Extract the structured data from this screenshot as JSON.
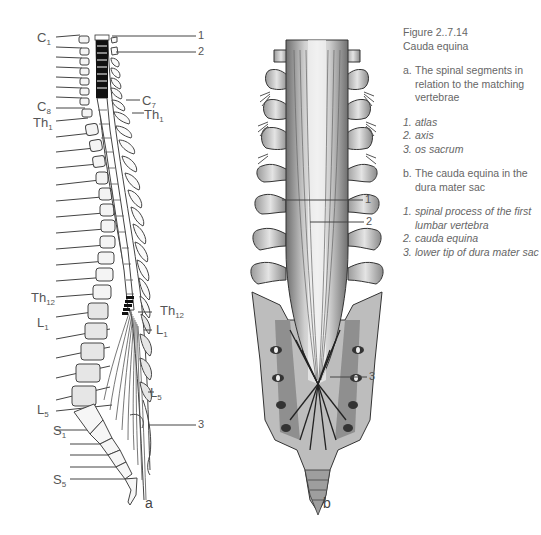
{
  "caption": {
    "figure_number": "Figure 2..7.14",
    "title": "Cauda equina",
    "part_a": {
      "key": "a.",
      "text": "The spinal segments in relation to the matching vertebrae",
      "items": [
        {
          "key": "1.",
          "text": "atlas"
        },
        {
          "key": "2.",
          "text": "axis"
        },
        {
          "key": "3.",
          "text": "os sacrum"
        }
      ]
    },
    "part_b": {
      "key": "b.",
      "text": "The cauda equina in the dura mater sac",
      "items": [
        {
          "key": "1.",
          "text": "spinal process of the first lumbar vertebra"
        },
        {
          "key": "2.",
          "text": "cauda equina"
        },
        {
          "key": "3.",
          "text": "lower tip of dura mater sac"
        }
      ]
    }
  },
  "figure_a": {
    "panel_label": "a",
    "left_labels": [
      {
        "id": "c1",
        "main": "C",
        "sub": "1"
      },
      {
        "id": "c8",
        "main": "C",
        "sub": "8"
      },
      {
        "id": "th1",
        "main": "Th",
        "sub": "1"
      },
      {
        "id": "th12",
        "main": "Th",
        "sub": "12"
      },
      {
        "id": "l1",
        "main": "L",
        "sub": "1"
      },
      {
        "id": "l5",
        "main": "L",
        "sub": "5"
      },
      {
        "id": "s1",
        "main": "S",
        "sub": "1"
      },
      {
        "id": "s5",
        "main": "S",
        "sub": "5"
      }
    ],
    "right_labels": [
      {
        "id": "c7",
        "main": "C",
        "sub": "7"
      },
      {
        "id": "th1",
        "main": "Th",
        "sub": "1"
      },
      {
        "id": "th12",
        "main": "Th",
        "sub": "12"
      },
      {
        "id": "l1",
        "main": "L",
        "sub": "1"
      },
      {
        "id": "l5",
        "main": "L",
        "sub": "5"
      }
    ],
    "callouts": [
      "1",
      "2",
      "3"
    ]
  },
  "figure_b": {
    "panel_label": "b",
    "callouts": [
      "1",
      "2",
      "3"
    ]
  },
  "colors": {
    "line": "#444444",
    "text": "#555555",
    "bone_fill": "#e8e8e8",
    "cord_black": "#111111"
  }
}
